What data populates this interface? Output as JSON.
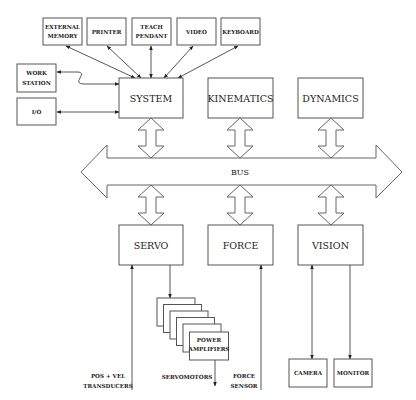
{
  "diagram": {
    "type": "block-diagram",
    "bus": {
      "label": "BUS"
    },
    "peripherals": [
      {
        "id": "external-memory",
        "lines": [
          "EXTERNAL",
          "MEMORY"
        ]
      },
      {
        "id": "printer",
        "lines": [
          "PRINTER"
        ]
      },
      {
        "id": "teach-pendant",
        "lines": [
          "TEACH",
          "PENDANT"
        ]
      },
      {
        "id": "video",
        "lines": [
          "VIDEO"
        ]
      },
      {
        "id": "keyboard",
        "lines": [
          "KEYBOARD"
        ]
      },
      {
        "id": "work-station",
        "lines": [
          "WORK",
          "STATION"
        ]
      },
      {
        "id": "io",
        "lines": [
          "I/O"
        ]
      }
    ],
    "modules": [
      {
        "id": "system",
        "label": "SYSTEM"
      },
      {
        "id": "kinematics",
        "label": "KINEMATICS"
      },
      {
        "id": "dynamics",
        "label": "DYNAMICS"
      },
      {
        "id": "servo",
        "label": "SERVO"
      },
      {
        "id": "force",
        "label": "FORCE"
      },
      {
        "id": "vision",
        "label": "VISION"
      }
    ],
    "power_amplifiers": {
      "lines": [
        "POWER",
        "AMPLIFIERS"
      ],
      "stack_count": 6
    },
    "devices": [
      {
        "id": "camera",
        "label": "CAMERA"
      },
      {
        "id": "monitor",
        "label": "MONITOR"
      }
    ],
    "signal_labels": {
      "pos_vel": [
        "POS + VEL",
        "TRANSDUCERS"
      ],
      "servomotors": "SERVOMOTORS",
      "force_sensor": [
        "FORCE",
        "SENSOR"
      ]
    },
    "connections": [
      {
        "from": "external-memory",
        "to": "system",
        "direction": "both"
      },
      {
        "from": "printer",
        "to": "system",
        "direction": "both"
      },
      {
        "from": "teach-pendant",
        "to": "system",
        "direction": "both"
      },
      {
        "from": "video",
        "to": "system",
        "direction": "both"
      },
      {
        "from": "keyboard",
        "to": "system",
        "direction": "both"
      },
      {
        "from": "work-station",
        "to": "system",
        "direction": "both"
      },
      {
        "from": "io",
        "to": "system",
        "direction": "both"
      },
      {
        "from": "system",
        "to": "bus",
        "direction": "both"
      },
      {
        "from": "kinematics",
        "to": "bus",
        "direction": "both"
      },
      {
        "from": "dynamics",
        "to": "bus",
        "direction": "both"
      },
      {
        "from": "servo",
        "to": "bus",
        "direction": "both"
      },
      {
        "from": "force",
        "to": "bus",
        "direction": "both"
      },
      {
        "from": "vision",
        "to": "bus",
        "direction": "both"
      },
      {
        "from": "pos-vel-transducers",
        "to": "servo",
        "direction": "forward"
      },
      {
        "from": "servo",
        "to": "power-amplifiers",
        "direction": "forward"
      },
      {
        "from": "power-amplifiers",
        "to": "servomotors",
        "direction": "forward"
      },
      {
        "from": "force-sensor",
        "to": "force",
        "direction": "forward"
      },
      {
        "from": "vision",
        "to": "camera",
        "direction": "both"
      },
      {
        "from": "vision",
        "to": "monitor",
        "direction": "forward"
      }
    ]
  }
}
